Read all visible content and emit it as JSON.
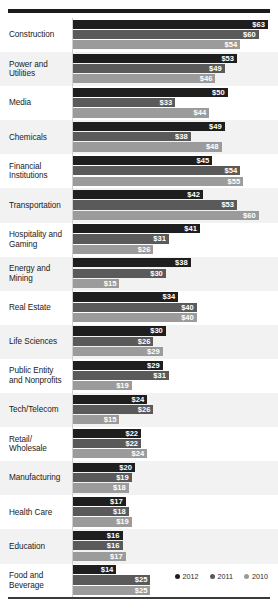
{
  "chart_data": {
    "type": "bar",
    "orientation": "horizontal",
    "title": "",
    "xlabel": "",
    "ylabel": "",
    "grid": false,
    "legend_position": "bottom-right",
    "value_prefix": "$",
    "xlim": [
      0,
      63
    ],
    "categories": [
      "Construction",
      "Power and Utilities",
      "Media",
      "Chemicals",
      "Financial Institutions",
      "Transportation",
      "Hospitality and Gaming",
      "Energy and Mining",
      "Real Estate",
      "Life Sciences",
      "Public Entity and Nonprofits",
      "Tech/Telecom",
      "Retail/ Wholesale",
      "Manufacturing",
      "Health Care",
      "Education",
      "Food and Beverage"
    ],
    "series": [
      {
        "name": "2012",
        "color": "#1e1e1e",
        "values": [
          63,
          53,
          50,
          49,
          45,
          42,
          41,
          38,
          34,
          30,
          29,
          24,
          22,
          20,
          17,
          16,
          14
        ]
      },
      {
        "name": "2011",
        "color": "#5a5a5a",
        "values": [
          60,
          49,
          33,
          38,
          54,
          53,
          31,
          30,
          40,
          26,
          31,
          26,
          22,
          19,
          18,
          16,
          25
        ]
      },
      {
        "name": "2010",
        "color": "#9b9b9b",
        "values": [
          54,
          46,
          44,
          48,
          55,
          60,
          26,
          15,
          40,
          29,
          19,
          15,
          24,
          18,
          19,
          17,
          25
        ]
      }
    ],
    "labels": [
      {
        "2012": "$63",
        "2011": "$60",
        "2010": "$54"
      },
      {
        "2012": "$53",
        "2011": "$49",
        "2010": "$46"
      },
      {
        "2012": "$50",
        "2011": "$33",
        "2010": "$44"
      },
      {
        "2012": "$49",
        "2011": "$38",
        "2010": "$48"
      },
      {
        "2012": "$45",
        "2011": "$54",
        "2010": "$55"
      },
      {
        "2012": "$42",
        "2011": "$53",
        "2010": "$60"
      },
      {
        "2012": "$41",
        "2011": "$31",
        "2010": "$26"
      },
      {
        "2012": "$38",
        "2011": "$30",
        "2010": "$15"
      },
      {
        "2012": "$34",
        "2011": "$40",
        "2010": "$40"
      },
      {
        "2012": "$30",
        "2011": "$26",
        "2010": "$29"
      },
      {
        "2012": "$29",
        "2011": "$31",
        "2010": "$19"
      },
      {
        "2012": "$24",
        "2011": "$26",
        "2010": "$15"
      },
      {
        "2012": "$22",
        "2011": "$22",
        "2010": "$24"
      },
      {
        "2012": "$20",
        "2011": "$19",
        "2010": "$18"
      },
      {
        "2012": "$17",
        "2011": "$18",
        "2010": "$19"
      },
      {
        "2012": "$16",
        "2011": "$16",
        "2010": "$17"
      },
      {
        "2012": "$14",
        "2011": "$25",
        "2010": "$25"
      }
    ]
  },
  "legend": {
    "items": [
      {
        "label": "2012",
        "series": "s2012"
      },
      {
        "label": "2011",
        "series": "s2011"
      },
      {
        "label": "2010",
        "series": "s2010"
      }
    ]
  }
}
